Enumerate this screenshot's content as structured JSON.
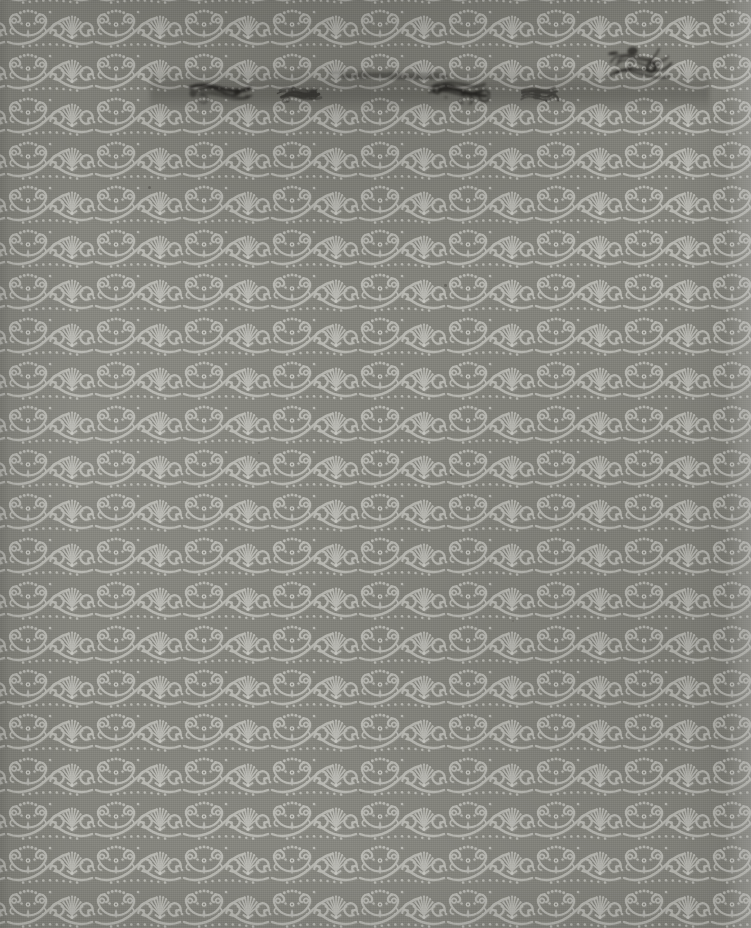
{
  "page": {
    "kind": "scanned-decorative-endpaper",
    "caption": "Scanned page of patterned damask endpaper",
    "width": 751,
    "height": 928
  },
  "palette": {
    "ground": "#83837c",
    "ground_dark": "#74746d",
    "ornament": "#b8b8b2",
    "ornament_light": "#c6c6c0",
    "ornament_shadow": "#9a9a93",
    "ink": "#24211e",
    "ink_soft": "#3a3632"
  },
  "pattern": {
    "name": "damask-arabesque-repeat",
    "tile_width": 88,
    "tile_height": 44,
    "offset_x": 6,
    "offset_y": 4,
    "motifs": [
      "palmette-fan",
      "crown-butterfly",
      "c-scroll",
      "bead-row",
      "volute-spiral"
    ],
    "columns": 9,
    "rows": 22
  },
  "surface": {
    "right_wash_label": "lightened right edge strip",
    "left_wash_label": "darkened left edge strip",
    "seams": [
      370,
      476
    ],
    "vignette_label": "scan vignette"
  },
  "defects": {
    "label": "ink bleed-through and foxing",
    "band": {
      "label": "horizontal ink bleed band",
      "x": 150,
      "y": 66,
      "width": 560,
      "height": 46
    },
    "marks": [
      {
        "name": "ink-blot-top-right",
        "x": 601,
        "y": 33,
        "width": 72,
        "height": 52,
        "opacity": 0.92,
        "rotate": -7
      },
      {
        "name": "ink-smudge-left",
        "x": 188,
        "y": 80,
        "width": 68,
        "height": 26,
        "opacity": 0.8,
        "rotate": 2
      },
      {
        "name": "ink-smudge-mid",
        "x": 276,
        "y": 84,
        "width": 46,
        "height": 18,
        "opacity": 0.55,
        "rotate": -3
      },
      {
        "name": "ink-smudge-center",
        "x": 428,
        "y": 80,
        "width": 62,
        "height": 24,
        "opacity": 0.78,
        "rotate": 3
      },
      {
        "name": "ink-smudge-right",
        "x": 520,
        "y": 86,
        "width": 40,
        "height": 16,
        "opacity": 0.5,
        "rotate": -2
      },
      {
        "name": "ink-streak-upper",
        "x": 330,
        "y": 70,
        "width": 120,
        "height": 10,
        "opacity": 0.34,
        "rotate": 0
      }
    ],
    "specks": [
      {
        "x": 148,
        "y": 186,
        "size": 3.0,
        "opacity": 0.55
      },
      {
        "x": 444,
        "y": 284,
        "size": 2.6,
        "opacity": 0.5
      },
      {
        "x": 258,
        "y": 452,
        "size": 2.2,
        "opacity": 0.42
      },
      {
        "x": 450,
        "y": 474,
        "size": 2.4,
        "opacity": 0.46
      },
      {
        "x": 690,
        "y": 120,
        "size": 2.0,
        "opacity": 0.38
      },
      {
        "x": 604,
        "y": 210,
        "size": 2.2,
        "opacity": 0.4
      },
      {
        "x": 96,
        "y": 640,
        "size": 2.0,
        "opacity": 0.33
      },
      {
        "x": 360,
        "y": 792,
        "size": 2.2,
        "opacity": 0.35
      },
      {
        "x": 512,
        "y": 620,
        "size": 1.8,
        "opacity": 0.3
      },
      {
        "x": 212,
        "y": 330,
        "size": 2.0,
        "opacity": 0.34
      }
    ]
  }
}
